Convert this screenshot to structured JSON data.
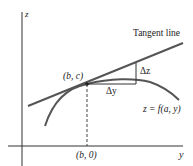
{
  "diagram": {
    "axes": {
      "vertical_label": "z",
      "horizontal_label": "y"
    },
    "labels": {
      "point": "(b, c)",
      "base_point": "(b, 0)",
      "tangent": "Tangent line",
      "delta_z": "Δz",
      "delta_y": "Δy",
      "curve": "z = f(a, y)"
    },
    "colors": {
      "axis": "#333333",
      "curve": "#555555",
      "tangent": "#555555",
      "text": "#222222"
    }
  }
}
